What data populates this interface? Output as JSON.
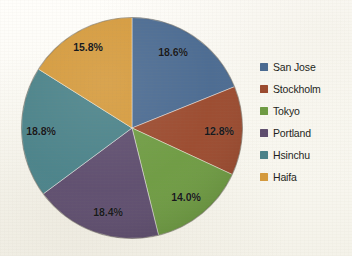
{
  "chart_data": {
    "type": "pie",
    "title": "",
    "labels": [
      "San Jose",
      "Stockholm",
      "Tokyo",
      "Portland",
      "Hsinchu",
      "Haifa"
    ],
    "values": [
      18.6,
      12.8,
      14.0,
      18.4,
      18.8,
      15.8
    ],
    "value_labels": [
      "18.6%",
      "12.8%",
      "14.0%",
      "18.4%",
      "18.8%",
      "15.8%"
    ],
    "colors": [
      "#4a6a91",
      "#9b4a2e",
      "#6e9b42",
      "#5e4d6e",
      "#4a8289",
      "#d59a3c"
    ],
    "units": "percent",
    "start_angle_deg": 0,
    "direction": "clockwise",
    "legend_position": "right",
    "grid": false,
    "slices": [
      {
        "label": "San Jose",
        "value": 18.6,
        "value_label": "18.6%",
        "color": "#4a6a91",
        "label_x": 173,
        "label_y": 52
      },
      {
        "label": "Stockholm",
        "value": 12.8,
        "value_label": "12.8%",
        "color": "#9b4a2e",
        "label_x": 219,
        "label_y": 131
      },
      {
        "label": "Tokyo",
        "value": 14.0,
        "value_label": "14.0%",
        "color": "#6e9b42",
        "label_x": 186,
        "label_y": 197
      },
      {
        "label": "Portland",
        "value": 18.4,
        "value_label": "18.4%",
        "color": "#5e4d6e",
        "label_x": 108,
        "label_y": 212
      },
      {
        "label": "Hsinchu",
        "value": 18.8,
        "value_label": "18.8%",
        "color": "#4a8289",
        "label_x": 41,
        "label_y": 131
      },
      {
        "label": "Haifa",
        "value": 15.8,
        "value_label": "15.8%",
        "color": "#d59a3c",
        "label_x": 88,
        "label_y": 47
      }
    ]
  },
  "legend": {
    "items": [
      {
        "label": "San Jose",
        "color": "#4a6a91"
      },
      {
        "label": "Stockholm",
        "color": "#9b4a2e"
      },
      {
        "label": "Tokyo",
        "color": "#6e9b42"
      },
      {
        "label": "Portland",
        "color": "#5e4d6e"
      },
      {
        "label": "Hsinchu",
        "color": "#4a8289"
      },
      {
        "label": "Haifa",
        "color": "#d59a3c"
      }
    ]
  }
}
